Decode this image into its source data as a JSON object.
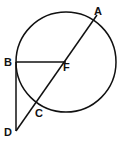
{
  "diagram": {
    "type": "geometry-circle-tangent-secant",
    "circle": {
      "cx": 66,
      "cy": 62,
      "r": 50
    },
    "points": [
      {
        "id": "A",
        "label": "A",
        "x": 97,
        "y": 15,
        "lx": 95,
        "ly": 15
      },
      {
        "id": "B",
        "label": "B",
        "x": 16,
        "y": 62,
        "lx": 4,
        "ly": 66
      },
      {
        "id": "F",
        "label": "F",
        "x": 66,
        "y": 62,
        "lx": 63,
        "ly": 71
      },
      {
        "id": "C",
        "label": "C",
        "x": 36,
        "y": 103,
        "lx": 35,
        "ly": 116
      },
      {
        "id": "D",
        "label": "D",
        "x": 16,
        "y": 131,
        "lx": 4,
        "ly": 135
      }
    ],
    "segments": [
      [
        "A",
        "D"
      ],
      [
        "B",
        "F"
      ],
      [
        "B",
        "D"
      ]
    ],
    "stroke_color": "#111111"
  }
}
